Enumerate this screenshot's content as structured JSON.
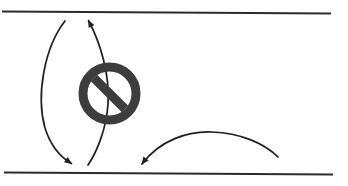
{
  "figure": {
    "background_color": "#ffffff",
    "width": 348,
    "height": 186
  },
  "palette": {
    "line_color": "#2b2b2b",
    "stroke_color": "#1f1f1f",
    "sign_color": "#3d3d3d",
    "background": "#ffffff"
  },
  "road": {
    "top_edge": {
      "label": "top road edge",
      "x1": 2,
      "y1": 11.5,
      "x2": 331,
      "y2": 13.5,
      "stroke_width": 2.2
    },
    "bottom_edge": {
      "label": "bottom road edge",
      "x1": 4,
      "y1": 172.5,
      "x2": 333,
      "y2": 174.5,
      "stroke_width": 2.2
    }
  },
  "trajectories": [
    {
      "name": "left-outbound-curve",
      "label": "Left outbound curve",
      "path": "M 65 21 C 44 48, 36 96, 45 128 C 51 147, 62 158, 71.5 163.5",
      "stroke_width": 1.7,
      "arrow": {
        "present": true,
        "position": "end",
        "x": 72,
        "y": 164,
        "angle": 35
      }
    },
    {
      "name": "left-inbound-curve",
      "label": "Left inbound curve",
      "path": "M 88.5 20.5 C 100 42, 110 74, 108 104 C 106.5 128, 97 152, 88 165",
      "stroke_width": 1.7,
      "arrow": {
        "present": true,
        "position": "start",
        "x": 88,
        "y": 20,
        "angle": -118
      }
    },
    {
      "name": "right-merge-arc",
      "label": "Right merge arc",
      "path": "M 142 164 C 160 140, 188 131, 212 132 C 240 133, 264 143, 278 157",
      "stroke_width": 1.7,
      "arrow": {
        "present": true,
        "position": "start",
        "x": 141.5,
        "y": 164.5,
        "angle": 127
      }
    }
  ],
  "prohibition_sign": {
    "label": "No entry / prohibited sign",
    "center_x": 109.5,
    "center_y": 93.5,
    "outer_radius": 31,
    "ring_width": 9,
    "slash_width": 9,
    "slash_angle": 45,
    "color": "#3d3d3d"
  }
}
